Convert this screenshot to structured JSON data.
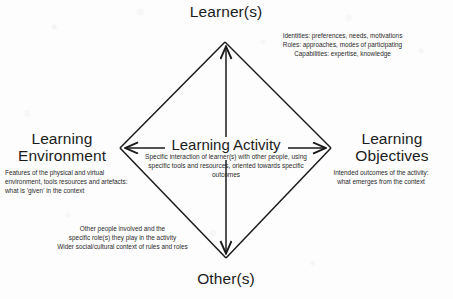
{
  "diagram": {
    "type": "learning-activity-diamond",
    "title_visible": false,
    "nodes": {
      "top": {
        "label": "Learner(s)",
        "annotation": "Identities: preferences, needs, motivations\nRoles: approaches, modes of participating\nCapabilities: expertise, knowledge"
      },
      "left": {
        "label": "Learning\nEnvironment",
        "annotation": "Features of the physical and virtual environment, tools resources and artefacts: what is 'given' in the context"
      },
      "right": {
        "label": "Learning\nObjectives",
        "annotation": "Intended outcomes of the activity:\nwhat emerges from the context"
      },
      "bottom": {
        "label": "Other(s)",
        "annotation": "Other people involved and the\nspecific role(s) they play in the activity\nWider social/cultural context of rules and roles"
      },
      "center": {
        "label": "Learning Activity",
        "annotation": "Specific interaction of learner(s) with other people, using specific tools and resources, oriented towards specific outcomes"
      }
    },
    "colors": {
      "background": "#fdfdfd",
      "stroke": "#1a1a1a",
      "text": "#1c1c1c"
    },
    "geometry": {
      "top_vertex": "225,42",
      "left_vertex": "120,148",
      "right_vertex": "331,148",
      "bottom_vertex": "226,258",
      "center": "226,148"
    }
  }
}
